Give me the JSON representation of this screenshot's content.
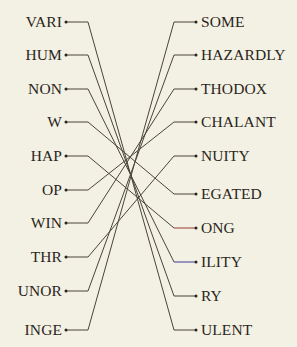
{
  "canvas": {
    "width": 297,
    "height": 347,
    "background_color": "#f3f1e4",
    "text_color": "#2a2520",
    "default_wire_color": "#4a443a"
  },
  "left_column": {
    "name": "prefix-column",
    "x_label_right": 62,
    "x_dot": 66,
    "elbow_x": 88,
    "items": [
      {
        "label": "VARI",
        "y": 22
      },
      {
        "label": "HUM",
        "y": 55
      },
      {
        "label": "NON",
        "y": 89
      },
      {
        "label": "W",
        "y": 122
      },
      {
        "label": "HAP",
        "y": 156
      },
      {
        "label": "OP",
        "y": 190
      },
      {
        "label": "WIN",
        "y": 223
      },
      {
        "label": "THR",
        "y": 257
      },
      {
        "label": "UNOR",
        "y": 291
      },
      {
        "label": "INGE",
        "y": 330
      }
    ]
  },
  "right_column": {
    "name": "suffix-column",
    "x_label_left": 201,
    "x_dot": 196,
    "elbow_x": 174,
    "items": [
      {
        "label": "SOME",
        "y": 22
      },
      {
        "label": "HAZARDLY",
        "y": 55
      },
      {
        "label": "THODOX",
        "y": 89
      },
      {
        "label": "CHALANT",
        "y": 122
      },
      {
        "label": "NUITY",
        "y": 156
      },
      {
        "label": "EGATED",
        "y": 194
      },
      {
        "label": "ONG",
        "y": 228
      },
      {
        "label": "ILITY",
        "y": 262
      },
      {
        "label": "RY",
        "y": 296
      },
      {
        "label": "ULENT",
        "y": 330
      }
    ]
  },
  "connections": [
    {
      "from": "VARI",
      "to": "ULENT",
      "from_y": 22,
      "to_y": 330,
      "color": "#4a443a"
    },
    {
      "from": "HUM",
      "to": "RY",
      "from_y": 55,
      "to_y": 296,
      "color": "#4a443a"
    },
    {
      "from": "NON",
      "to": "ILITY",
      "from_y": 89,
      "to_y": 262,
      "color": "#4a443a",
      "target_stub_color": "#3a3a9a"
    },
    {
      "from": "W",
      "to": "EGATED",
      "from_y": 122,
      "to_y": 194,
      "color": "#4a443a"
    },
    {
      "from": "HAP",
      "to": "ONG",
      "from_y": 156,
      "to_y": 228,
      "color": "#4a443a",
      "target_stub_color": "#9a3a2a"
    },
    {
      "from": "OP",
      "to": "CHALANT",
      "from_y": 190,
      "to_y": 122,
      "color": "#4a443a"
    },
    {
      "from": "WIN",
      "to": "THODOX",
      "from_y": 223,
      "to_y": 89,
      "color": "#4a443a"
    },
    {
      "from": "THR",
      "to": "NUITY",
      "from_y": 257,
      "to_y": 156,
      "color": "#4a443a"
    },
    {
      "from": "UNOR",
      "to": "HAZARDLY",
      "from_y": 291,
      "to_y": 55,
      "color": "#4a443a"
    },
    {
      "from": "INGE",
      "to": "SOME",
      "from_y": 330,
      "to_y": 22,
      "color": "#4a443a"
    }
  ]
}
